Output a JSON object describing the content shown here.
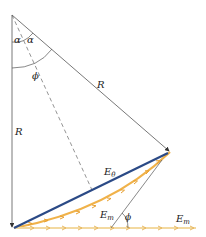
{
  "labels": {
    "alpha_left": "α",
    "alpha_right": "α",
    "phi_top": "ϕ",
    "R_diagonal": "R",
    "R_vertical": "R",
    "E_theta_base": "E",
    "E_theta_sub": "θ",
    "E_m_curve_base": "E",
    "E_m_curve_sub": "m",
    "phi_bottom": "ϕ",
    "E_m_line_base": "E",
    "E_m_line_sub": "m"
  },
  "colors": {
    "lines": "#555555",
    "chord": "#2b4a86",
    "phasor_arrows": "#f0b24a",
    "phasor_arrows_light": "#f3d9a0"
  }
}
